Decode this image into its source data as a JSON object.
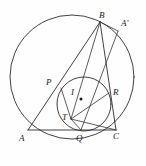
{
  "figure": {
    "caption": "",
    "stroke_color": "#2b2b2b",
    "background_color": "#fefefe",
    "labels": [
      {
        "id": "B",
        "text": "B",
        "x": 99,
        "y": 11
      },
      {
        "id": "Ap",
        "text": "A'",
        "x": 121,
        "y": 19
      },
      {
        "id": "P",
        "text": "P",
        "x": 46,
        "y": 78
      },
      {
        "id": "I",
        "text": "I",
        "x": 71,
        "y": 88
      },
      {
        "id": "R",
        "text": "R",
        "x": 113,
        "y": 88
      },
      {
        "id": "T",
        "text": "T",
        "x": 62,
        "y": 113
      },
      {
        "id": "A",
        "text": "A",
        "x": 19,
        "y": 134
      },
      {
        "id": "Q",
        "text": "Q",
        "x": 76,
        "y": 134
      },
      {
        "id": "C",
        "text": "C",
        "x": 113,
        "y": 132
      }
    ],
    "points": [
      {
        "id": "A",
        "x": 28,
        "y": 130
      },
      {
        "id": "B",
        "x": 100,
        "y": 22
      },
      {
        "id": "C",
        "x": 116,
        "y": 130
      },
      {
        "id": "Ap",
        "x": 118,
        "y": 31
      },
      {
        "id": "P",
        "x": 61,
        "y": 88
      },
      {
        "id": "Q",
        "x": 81,
        "y": 130
      },
      {
        "id": "R",
        "x": 109,
        "y": 93
      },
      {
        "id": "T",
        "x": 71,
        "y": 119
      },
      {
        "id": "I",
        "x": 81,
        "y": 99
      }
    ],
    "circles": [
      {
        "id": "circumcircle",
        "cx": 72,
        "cy": 77,
        "r": 62
      },
      {
        "id": "incircle",
        "cx": 84,
        "cy": 104,
        "r": 27
      }
    ],
    "segments": [
      {
        "id": "AC",
        "x1": 28,
        "y1": 130,
        "x2": 116,
        "y2": 130
      },
      {
        "id": "AB",
        "x1": 28,
        "y1": 130,
        "x2": 100,
        "y2": 22
      },
      {
        "id": "BC",
        "x1": 100,
        "y1": 22,
        "x2": 116,
        "y2": 130
      },
      {
        "id": "BAp",
        "x1": 100,
        "y1": 22,
        "x2": 118,
        "y2": 31
      },
      {
        "id": "ApQ",
        "x1": 118,
        "y1": 31,
        "x2": 81,
        "y2": 130
      },
      {
        "id": "PT",
        "x1": 61,
        "y1": 88,
        "x2": 71,
        "y2": 119
      },
      {
        "id": "TR",
        "x1": 71,
        "y1": 119,
        "x2": 109,
        "y2": 93
      },
      {
        "id": "TB",
        "x1": 71,
        "y1": 119,
        "x2": 100,
        "y2": 22
      },
      {
        "id": "TQ",
        "x1": 71,
        "y1": 119,
        "x2": 81,
        "y2": 130
      },
      {
        "id": "TC",
        "x1": 71,
        "y1": 119,
        "x2": 116,
        "y2": 130
      }
    ],
    "incenter_dot": {
      "cx": 81,
      "cy": 99,
      "r": 1.5
    }
  }
}
